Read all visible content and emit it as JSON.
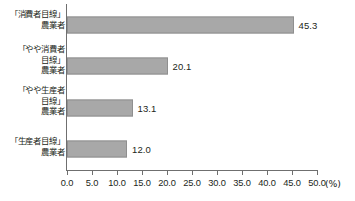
{
  "chart_data": {
    "type": "bar",
    "orientation": "horizontal",
    "title": "",
    "subtitle": "",
    "xlabel": "(%)",
    "ylabel": "",
    "categories": [
      "「消費者目線」\n農業者",
      "「やや消費者\n目線」\n農業者",
      "「やや生産者\n目線」\n農業者",
      "「生産者目線」\n農業者"
    ],
    "values": [
      45.3,
      20.1,
      13.1,
      12.0
    ],
    "data_labels": [
      "45.3",
      "20.1",
      "13.1",
      "12.0"
    ],
    "xlim": [
      0.0,
      50.0
    ],
    "xticks": [
      0.0,
      5.0,
      10.0,
      15.0,
      20.0,
      25.0,
      30.0,
      35.0,
      40.0,
      45.0,
      50.0
    ],
    "xtick_labels": [
      "0.0",
      "5.0",
      "10.0",
      "15.0",
      "20.0",
      "25.0",
      "30.0",
      "35.0",
      "40.0",
      "45.0",
      "50.0"
    ],
    "unit": "(%)",
    "grid": false,
    "legend": null,
    "bar_color": "#a8a8a8",
    "bar_border_color": "#8f8f8f",
    "axis_color": "#6f6f6f",
    "text_color": "#231f20"
  }
}
